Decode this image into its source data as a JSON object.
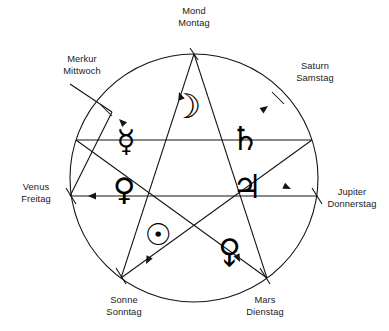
{
  "figure": {
    "background_color": "#ffffff",
    "line_color": "#141414",
    "text_color": "#1a1a1a"
  },
  "vertices": [
    {
      "key": "mond",
      "planet": "Mond",
      "weekday": "Montag",
      "symbol": "☽",
      "symbol_name": "moon-symbol",
      "angle_deg": 90,
      "label_x": 194,
      "label_y": 14,
      "label_anchor": "middle",
      "glyph_x": 186,
      "glyph_y": 118,
      "glyph_size": 34,
      "glyph_rotate": 0
    },
    {
      "key": "merkur",
      "planet": "Merkur",
      "weekday": "Mittwoch",
      "symbol": "☿",
      "symbol_name": "mercury-symbol",
      "angle_deg": 162,
      "label_x": 82,
      "label_y": 62,
      "label_anchor": "middle",
      "glyph_x": 126,
      "glyph_y": 152,
      "glyph_size": 31,
      "glyph_rotate": 0
    },
    {
      "key": "saturn",
      "planet": "Saturn",
      "weekday": "Samstag",
      "symbol": "♄",
      "symbol_name": "saturn-symbol",
      "angle_deg": 18,
      "label_x": 315,
      "label_y": 69,
      "label_anchor": "middle",
      "glyph_x": 245,
      "glyph_y": 150,
      "glyph_size": 33,
      "glyph_rotate": 0
    },
    {
      "key": "venus",
      "planet": "Venus",
      "weekday": "Freitag",
      "symbol": "♀",
      "symbol_name": "venus-symbol",
      "angle_deg": 180,
      "label_x": 36,
      "label_y": 190,
      "label_anchor": "middle",
      "glyph_x": 124,
      "glyph_y": 200,
      "glyph_size": 31,
      "glyph_rotate": 0
    },
    {
      "key": "jupiter",
      "planet": "Jupiter",
      "weekday": "Donnerstag",
      "symbol": "♃",
      "symbol_name": "jupiter-symbol",
      "angle_deg": 0,
      "label_x": 352,
      "label_y": 195,
      "label_anchor": "middle",
      "glyph_x": 247,
      "glyph_y": 198,
      "glyph_size": 33,
      "glyph_rotate": 0
    },
    {
      "key": "sonne",
      "planet": "Sonne",
      "weekday": "Sonntag",
      "symbol": "☉",
      "symbol_name": "sun-symbol",
      "angle_deg": 234,
      "label_x": 124,
      "label_y": 303,
      "label_anchor": "middle",
      "glyph_x": 158,
      "glyph_y": 245,
      "glyph_size": 30,
      "glyph_rotate": 0
    },
    {
      "key": "mars",
      "planet": "Mars",
      "weekday": "Dienstag",
      "symbol": "♂",
      "symbol_name": "mars-symbol",
      "angle_deg": 306,
      "label_x": 265,
      "label_y": 303,
      "label_anchor": "middle",
      "glyph_x": 222,
      "glyph_y": 243,
      "glyph_size": 31,
      "glyph_rotate": 135
    }
  ],
  "labels": [
    {
      "planet": "Mond",
      "weekday": "Montag"
    },
    {
      "planet": "Merkur",
      "weekday": "Mittwoch"
    },
    {
      "planet": "Saturn",
      "weekday": "Samstag"
    },
    {
      "planet": "Venus",
      "weekday": "Freitag"
    },
    {
      "planet": "Jupiter",
      "weekday": "Donnerstag"
    },
    {
      "planet": "Sonne",
      "weekday": "Sonntag"
    },
    {
      "planet": "Mars",
      "weekday": "Dienstag"
    }
  ],
  "geometry": {
    "center_x": 194,
    "center_y": 178,
    "radius": 124,
    "star_radius": 124,
    "point_count": 5,
    "star_order": [
      0,
      2,
      4,
      1,
      3
    ]
  },
  "star_points": [
    {
      "name": "top",
      "x": 194,
      "y": 54
    },
    {
      "name": "right",
      "x": 312,
      "y": 140
    },
    {
      "name": "bottom-right",
      "x": 267,
      "y": 278
    },
    {
      "name": "bottom-left",
      "x": 121,
      "y": 278
    },
    {
      "name": "left",
      "x": 76,
      "y": 140
    }
  ],
  "arrows": [
    {
      "name": "to-merkur",
      "at_x": 119,
      "at_y": 119,
      "rotate": 225
    },
    {
      "name": "to-saturn",
      "at_x": 264,
      "at_y": 104,
      "rotate": 322
    },
    {
      "name": "to-mond",
      "at_x": 180,
      "at_y": 92,
      "rotate": 245
    },
    {
      "name": "to-jupiter",
      "at_x": 288,
      "at_y": 188,
      "rotate": 25
    },
    {
      "name": "to-venus",
      "at_x": 92,
      "at_y": 196,
      "rotate": 180
    },
    {
      "name": "to-sonne",
      "at_x": 146,
      "at_y": 262,
      "rotate": 118
    },
    {
      "name": "to-mars",
      "at_x": 238,
      "at_y": 258,
      "rotate": 64
    }
  ]
}
